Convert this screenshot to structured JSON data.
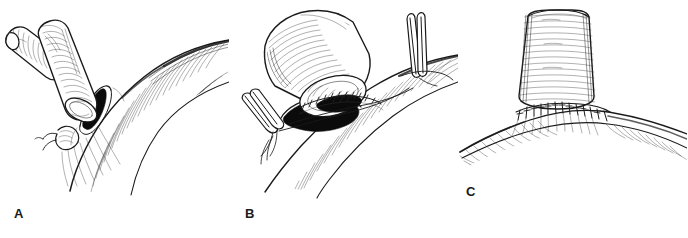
{
  "figure": {
    "type": "surgical-technique-illustration",
    "medium": "pen-and-ink line drawing",
    "background_color": "#ffffff",
    "ink_color": "#1a1a1a",
    "panel_count": 3,
    "caption": ""
  },
  "panels": [
    {
      "id": "panel-a",
      "label": "A",
      "label_position": {
        "x": 14,
        "y": 207
      },
      "description": "Bifurcated vessel graft held above the recipient artery; an oval arteriotomy has been made in the artery wall and a stay suture is placed at the proximal apex.",
      "elements": [
        {
          "name": "bifurcated-graft",
          "detail": "Y-shaped tubular graft with two limbs, circumferential hatch shading, beveled open cut end facing the arteriotomy"
        },
        {
          "name": "graft-lumen-opening",
          "detail": "elliptical open end of graft, white lumen with dark rim"
        },
        {
          "name": "recipient-artery",
          "detail": "large curving vessel running from upper right to lower left, dense parallel hatch shading"
        },
        {
          "name": "arteriotomy",
          "detail": "solid black elongated oval opening in the artery wall"
        },
        {
          "name": "apex-stay-suture",
          "detail": "small knotted suture with needle at the lower apex of the arteriotomy"
        }
      ]
    },
    {
      "id": "panel-b",
      "label": "B",
      "label_position": {
        "x": 245,
        "y": 207
      },
      "description": "The graft is parachuted down onto the arteriotomy and a continuous running suture is placed around the heel and side of the anastomosis while two forceps hold the suture ends under tension.",
      "elements": [
        {
          "name": "graft-tube",
          "detail": "cylindrical graft angled from upper left to lower right with circumferential hatching"
        },
        {
          "name": "graft-cut-edge",
          "detail": "open beveled end of graft showing ribbed inner wall"
        },
        {
          "name": "arteriotomy",
          "detail": "solid black oval opening beneath the graft"
        },
        {
          "name": "running-suture-line",
          "detail": "row of small stitch marks along the upper rim of the anastomosis"
        },
        {
          "name": "left-forceps",
          "detail": "two-tined fine forceps at lower left grasping a suture tail"
        },
        {
          "name": "right-forceps",
          "detail": "two-tined fine forceps at upper right grasping the other suture tail"
        },
        {
          "name": "suture-strands",
          "detail": "long fine lines running from each forceps to the anastomosis"
        },
        {
          "name": "recipient-artery",
          "detail": "vessel running diagonally from upper right down to lower left with hatch shading"
        }
      ]
    },
    {
      "id": "panel-c",
      "label": "C",
      "label_position": {
        "x": 466,
        "y": 185
      },
      "description": "The completed end-to-side anastomosis; the graft rises vertically from the artery and the circumferential suture line is shown as a ring of interrupted stitch marks.",
      "elements": [
        {
          "name": "graft-tube",
          "detail": "vertical tubular graft with horizontal ring hatching, flaring slightly at the base"
        },
        {
          "name": "completed-suture-line",
          "detail": "horizontal band of stitch marks encircling the junction of graft and artery"
        },
        {
          "name": "recipient-artery",
          "detail": "vessel sweeping from lower left to right beneath the anastomosis with hatch shading"
        }
      ]
    }
  ]
}
